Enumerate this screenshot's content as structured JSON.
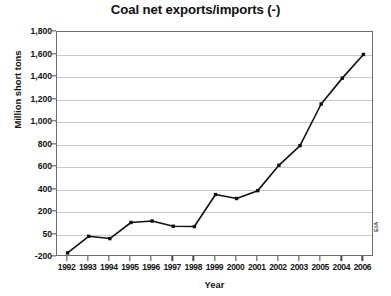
{
  "chart_data": {
    "type": "line",
    "title": "Coal net exports/imports (-)",
    "xlabel": "Year",
    "ylabel": "Million short tons",
    "attribution": "EIA",
    "grid": true,
    "legend": false,
    "legend_position": "none",
    "categories": [
      "1992",
      "1993",
      "1994",
      "1995",
      "1996",
      "1997",
      "1998",
      "1999",
      "2000",
      "2001",
      "2002",
      "2003",
      "2005",
      "2004",
      "2006"
    ],
    "values": [
      -155,
      30,
      5,
      130,
      140,
      105,
      103,
      355,
      320,
      390,
      615,
      790,
      1160,
      1390,
      1600
    ],
    "series": [
      {
        "name": "Coal net exports/imports (-)",
        "values": [
          -155,
          30,
          5,
          130,
          140,
          105,
          103,
          355,
          320,
          390,
          615,
          790,
          1160,
          1390,
          1600
        ],
        "color": "#111111",
        "marker": "square"
      }
    ],
    "y_ticks": [
      "1,800",
      "1,600",
      "1,400",
      "1,200",
      "1,000",
      "800",
      "600",
      "400",
      "200",
      "50",
      "-200"
    ],
    "y_tick_values": [
      1800,
      1600,
      1400,
      1200,
      1000,
      800,
      600,
      400,
      200,
      50,
      -200
    ],
    "y_axis_note": "Tick spacing is uniform on screen although the lowest intervals (200, 50, -200) are not linearly scaled.",
    "ylim": [
      -200,
      1800
    ],
    "x_ticks": [
      "1992",
      "1993",
      "1994",
      "1995",
      "1996",
      "1997",
      "1998",
      "1999",
      "2000",
      "2001",
      "2002",
      "2003",
      "2005",
      "2004",
      "2006"
    ],
    "x_axis_note": "Tick labels appear out of chronological order near the end: 2002, 2003, 2005, 2004, 2006.",
    "colors": {
      "line": "#111111",
      "marker": "#111111",
      "grid": "#c9c9c9",
      "axis": "#6e6e6e",
      "background": "#ffffff",
      "text": "#111111"
    }
  }
}
